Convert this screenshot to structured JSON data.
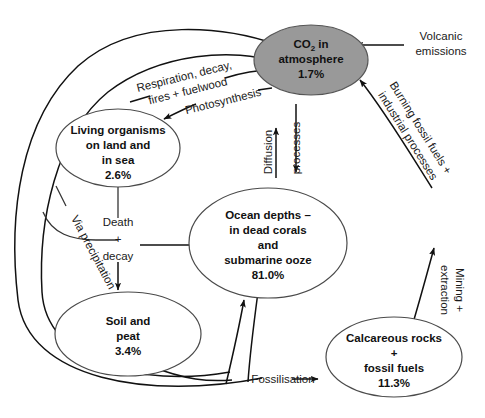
{
  "diagram": {
    "colors": {
      "co2_fill": "#999999",
      "stroke": "#111111",
      "ellipse_stroke": "#4a4a4a",
      "background": "#ffffff"
    },
    "nodes": [
      {
        "id": "co2",
        "name": "co2-atmosphere",
        "lines": [
          "CO",
          "2",
          " in",
          "atmosphere",
          "1.7%"
        ],
        "line1_main": "CO",
        "line1_sub": "2",
        "line1_tail": " in",
        "line2": "atmosphere",
        "line3": "1.7%",
        "percent": "1.7%",
        "filled": true
      },
      {
        "id": "living",
        "name": "living-organisms",
        "line1": "Living organisms",
        "line2": "on land and",
        "line3": "in sea",
        "line4": "2.6%",
        "percent": "2.6%",
        "filled": false
      },
      {
        "id": "ocean",
        "name": "ocean-depths",
        "line1": "Ocean depths –",
        "line2": "in dead corals",
        "line3": "and",
        "line4": "submarine ooze",
        "line5": "81.0%",
        "percent": "81.0%",
        "filled": false
      },
      {
        "id": "soil",
        "name": "soil-and-peat",
        "line1": "Soil and",
        "line2": "peat",
        "line3": "3.4%",
        "percent": "3.4%",
        "filled": false
      },
      {
        "id": "rocks",
        "name": "calcareous-rocks",
        "line1": "Calcareous rocks",
        "line2": "+",
        "line3": "fossil fuels",
        "line4": "11.3%",
        "percent": "11.3%",
        "filled": false
      }
    ],
    "edge_labels": {
      "respiration_l1": "Respiration, decay,",
      "respiration_l2": "fires + fuelwood",
      "photosynthesis": "Photosynthesis",
      "diffusion": "Diffusion",
      "processes": "processes",
      "volcanic_l1": "Volcanic",
      "volcanic_l2": "emissions",
      "burning_l1": "Burning fossil fuels +",
      "burning_l2": "industrial processes",
      "mining_l1": "Mining +",
      "mining_l2": "extraction",
      "via_precipitation": "Via precipitation",
      "death_l1": "Death",
      "death_l2": "+",
      "death_l3": "decay",
      "fossilisation": "Fossilisation"
    }
  }
}
